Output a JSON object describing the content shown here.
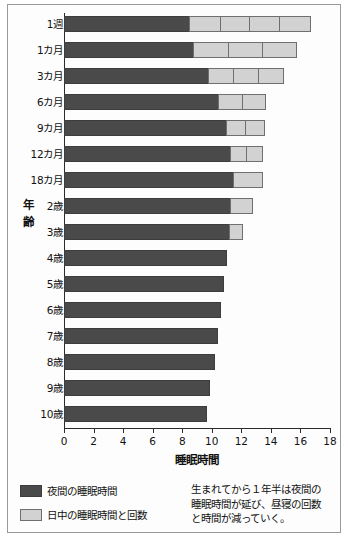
{
  "chart_data": {
    "type": "bar",
    "orientation": "horizontal",
    "stacked": true,
    "title": "",
    "xlabel": "睡眠時間",
    "ylabel": "年齢",
    "xlim": [
      0,
      18
    ],
    "xticks": [
      0,
      2,
      4,
      6,
      8,
      10,
      12,
      14,
      16,
      18
    ],
    "grid": false,
    "legend_position": "bottom-left",
    "categories": [
      "1週",
      "1カ月",
      "3カ月",
      "6カ月",
      "9カ月",
      "12カ月",
      "18カ月",
      "2歳",
      "3歳",
      "4歳",
      "5歳",
      "6歳",
      "7歳",
      "8歳",
      "9歳",
      "10歳"
    ],
    "series": [
      {
        "name": "夜間の睡眠時間",
        "color": "#4a4a4a",
        "values": [
          8.5,
          8.8,
          9.8,
          10.5,
          11.0,
          11.3,
          11.5,
          11.3,
          11.2,
          11.0,
          10.8,
          10.6,
          10.4,
          10.2,
          9.9,
          9.7
        ]
      },
      {
        "name": "日中の睡眠時間と回数",
        "color": "#d2d2d2",
        "naps": [
          [
            2.1,
            2.0,
            2.0,
            2.1
          ],
          [
            2.4,
            2.3,
            2.3
          ],
          [
            1.7,
            1.7,
            1.7
          ],
          [
            1.6,
            1.6
          ],
          [
            1.3,
            1.3
          ],
          [
            1.1,
            1.1
          ],
          [
            2.0
          ],
          [
            1.5
          ],
          [
            0.9
          ],
          [],
          [],
          [],
          [],
          [],
          [],
          []
        ]
      }
    ],
    "totals": [
      16.7,
      15.8,
      14.9,
      13.7,
      13.6,
      13.5,
      13.5,
      12.8,
      12.1,
      11.0,
      10.8,
      10.6,
      10.4,
      10.2,
      9.9,
      9.7
    ],
    "annotation": "生まれてから１年半は夜間の睡眠時間が延び、昼寝の回数と時間が減っていく。"
  },
  "legend": {
    "items": [
      {
        "label": "夜間の睡眠時間",
        "color": "#4a4a4a"
      },
      {
        "label": "日中の睡眠時間と回数",
        "color": "#d2d2d2"
      }
    ]
  },
  "note": {
    "line1": "生まれてから１年半は夜間の",
    "line2": "睡眠時間が延び、昼寝の回数",
    "line3": "と時間が減っていく。"
  },
  "axes": {
    "xlabel": "睡眠時間",
    "ylabel_chars": [
      "年",
      "齢"
    ],
    "xticks": [
      "0",
      "2",
      "4",
      "6",
      "8",
      "10",
      "12",
      "14",
      "16",
      "18"
    ]
  },
  "caption": ""
}
